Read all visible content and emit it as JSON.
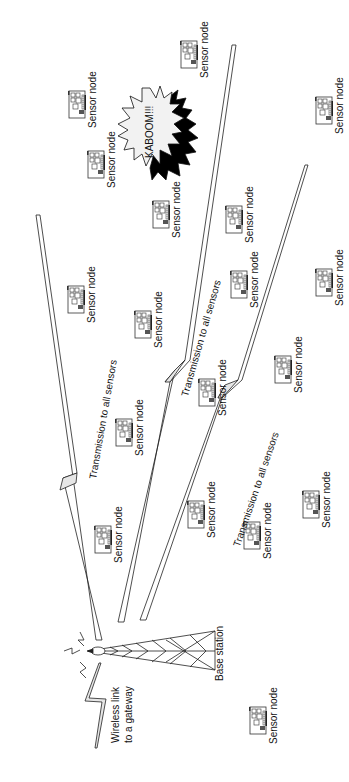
{
  "diagram": {
    "orientation": "rotated -90deg",
    "base_station": {
      "label": "Base station",
      "x": 100,
      "y": 633
    },
    "gateway_link": {
      "label_line1": "Wireless link",
      "label_line2": "to a gateway"
    },
    "explosion": {
      "label": "KABOOM!!!",
      "fill": "#f2f2f2",
      "shadow": "#000000"
    },
    "beams": [
      {
        "label": "Transmission to all sensors",
        "label_x": 88,
        "label_y": 480
      },
      {
        "label": "Transmission to all sensors",
        "label_x": 182,
        "label_y": 395
      },
      {
        "label": "Transmission to all sensors",
        "label_x": 231,
        "label_y": 545
      }
    ],
    "sensor_nodes": [
      {
        "label": "Sensor node",
        "icon_x": 66,
        "icon_y": 90
      },
      {
        "label": "Sensor node",
        "icon_x": 85,
        "icon_y": 150
      },
      {
        "label": "Sensor node",
        "icon_x": 178,
        "icon_y": 40
      },
      {
        "label": "Sensor node",
        "icon_x": 150,
        "icon_y": 200
      },
      {
        "label": "Sensor node",
        "icon_x": 223,
        "icon_y": 205
      },
      {
        "label": "Sensor node",
        "icon_x": 313,
        "icon_y": 96
      },
      {
        "label": "Sensor node",
        "icon_x": 65,
        "icon_y": 285
      },
      {
        "label": "Sensor node",
        "icon_x": 132,
        "icon_y": 310
      },
      {
        "label": "Sensor node",
        "icon_x": 228,
        "icon_y": 270
      },
      {
        "label": "Sensor node",
        "icon_x": 313,
        "icon_y": 268
      },
      {
        "label": "Sensor node",
        "icon_x": 113,
        "icon_y": 418
      },
      {
        "label": "Sensor node",
        "icon_x": 196,
        "icon_y": 378
      },
      {
        "label": "Sensor node",
        "icon_x": 272,
        "icon_y": 355
      },
      {
        "label": "Sensor node",
        "icon_x": 92,
        "icon_y": 525
      },
      {
        "label": "Sensor node",
        "icon_x": 185,
        "icon_y": 500
      },
      {
        "label": "Sensor node",
        "icon_x": 241,
        "icon_y": 521
      },
      {
        "label": "Sensor node",
        "icon_x": 300,
        "icon_y": 490
      },
      {
        "label": "Sensor node",
        "icon_x": 247,
        "icon_y": 706
      }
    ],
    "colors": {
      "line": "#222222",
      "beam_fill": "#e6e6e6",
      "text": "#111111",
      "background": "#ffffff"
    }
  }
}
